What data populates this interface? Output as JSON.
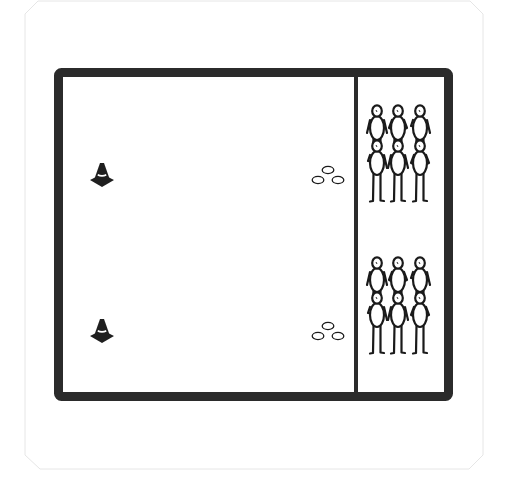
{
  "diagram": {
    "type": "sports-drill-layout",
    "colors": {
      "background": "#ffffff",
      "card_border": "#e6e6e6",
      "field_line": "#2b2b2b",
      "figure_stroke": "#1a1a1a",
      "ring_stroke": "#1a1a1a",
      "cone_fill": "#1f1f1f"
    },
    "field": {
      "x": 54,
      "y": 68,
      "width": 399,
      "height": 333,
      "border_width": 9,
      "divider_x": 356,
      "divider_width": 4
    },
    "cones": [
      {
        "name": "cone-top",
        "x": 102,
        "y": 163
      },
      {
        "name": "cone-bottom",
        "x": 102,
        "y": 319
      }
    ],
    "ring_clusters": [
      {
        "name": "rings-top",
        "x": 328,
        "y": 170
      },
      {
        "name": "rings-bottom",
        "x": 328,
        "y": 326
      }
    ],
    "player_groups": [
      {
        "name": "player-group-top",
        "count": 6,
        "back_row_y": 106,
        "front_row_y": 141,
        "columns_x": [
          377,
          398,
          420
        ]
      },
      {
        "name": "player-group-bottom",
        "count": 6,
        "back_row_y": 258,
        "front_row_y": 293,
        "columns_x": [
          377,
          398,
          420
        ]
      }
    ]
  }
}
